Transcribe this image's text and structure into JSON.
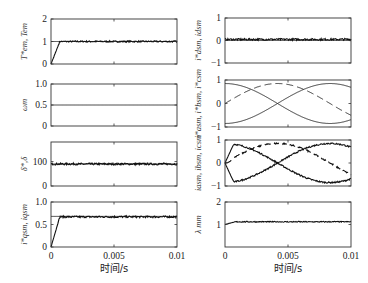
{
  "chart_data": [
    {
      "id": "te",
      "type": "line",
      "ylabel": "T*em, Tem",
      "ylim": [
        0,
        2
      ],
      "yticks": [
        "0",
        "1",
        "2"
      ],
      "xlim": [
        0,
        0.01
      ],
      "series": [
        {
          "name": "T*em",
          "style": "ref",
          "shape": "step",
          "value": 1
        },
        {
          "name": "Tem",
          "style": "noisy",
          "shape": "ramp",
          "value": 1,
          "ramp_end": 0.0007,
          "noise": 0.03
        }
      ]
    },
    {
      "id": "wm",
      "type": "line",
      "ylabel": "ωm",
      "ylim": [
        0,
        1.0
      ],
      "yticks": [
        "0",
        "0.5",
        "1.0"
      ],
      "xlim": [
        0,
        0.01
      ],
      "series": [
        {
          "name": "ωm",
          "style": "ref",
          "shape": "const",
          "value": 0.5
        }
      ]
    },
    {
      "id": "delta",
      "type": "line",
      "ylabel": "δ*,δ",
      "ylim": [
        0,
        180
      ],
      "yticks": [
        "0",
        "100"
      ],
      "xlim": [
        0,
        0.01
      ],
      "series": [
        {
          "name": "δ*",
          "style": "ref",
          "shape": "const",
          "value": 90
        },
        {
          "name": "δ",
          "style": "noisy",
          "shape": "const",
          "value": 90,
          "noise": 4
        }
      ]
    },
    {
      "id": "iqsm",
      "type": "line",
      "ylabel": "i*qsm, iqsm",
      "ylim": [
        0,
        1.0
      ],
      "yticks": [
        "0",
        "0.5",
        "1.0"
      ],
      "xticks": [
        "0",
        "0.005",
        "0.01"
      ],
      "xlabel": "时间/s",
      "xlim": [
        0,
        0.01
      ],
      "series": [
        {
          "name": "i*qsm",
          "style": "ref",
          "shape": "const",
          "value": 0.68
        },
        {
          "name": "iqsm",
          "style": "noisy",
          "shape": "ramp",
          "value": 0.67,
          "ramp_end": 0.0007,
          "noise": 0.02
        }
      ]
    },
    {
      "id": "idsm",
      "type": "line",
      "ylabel": "i*dsm, idsm",
      "ylim": [
        -1,
        1
      ],
      "yticks": [
        "-1",
        "0",
        "1"
      ],
      "xlim": [
        0,
        0.01
      ],
      "series": [
        {
          "name": "i*dsm",
          "style": "ref",
          "shape": "const",
          "value": 0
        },
        {
          "name": "idsm",
          "style": "noisy",
          "shape": "const",
          "value": 0.05,
          "noise": 0.04
        }
      ]
    },
    {
      "id": "iref3",
      "type": "line",
      "ylabel": "i*asm, i*bsm, i*csm",
      "ylim": [
        -1,
        1
      ],
      "yticks": [
        "-1",
        "0",
        "1"
      ],
      "xlim": [
        0,
        0.01
      ],
      "series": [
        {
          "name": "i*asm",
          "style": "solid",
          "shape": "sine",
          "amp": 0.85,
          "phase_deg": 90
        },
        {
          "name": "i*bsm",
          "style": "dashed",
          "shape": "sine",
          "amp": 0.85,
          "phase_deg": 0
        },
        {
          "name": "i*csm",
          "style": "solid",
          "shape": "sine",
          "amp": 0.85,
          "phase_deg": -90
        }
      ]
    },
    {
      "id": "i3",
      "type": "line",
      "ylabel": "iasm, ibsm, icsm",
      "ylim": [
        -1,
        1
      ],
      "yticks": [
        "-1",
        "0",
        "1"
      ],
      "xlim": [
        0,
        0.01
      ],
      "series": [
        {
          "name": "iasm",
          "style": "noisy",
          "shape": "sine",
          "amp": 0.85,
          "phase_deg": 90,
          "ramp_end": 0.0007,
          "noise": 0.03
        },
        {
          "name": "ibsm",
          "style": "noisy-dashed",
          "shape": "sine",
          "amp": 0.85,
          "phase_deg": 0,
          "ramp_end": 0.0007,
          "noise": 0.03
        },
        {
          "name": "icsm",
          "style": "noisy",
          "shape": "sine",
          "amp": 0.85,
          "phase_deg": -90,
          "ramp_end": 0.0007,
          "noise": 0.03
        }
      ]
    },
    {
      "id": "lambda",
      "type": "line",
      "ylabel": "λ mm",
      "ylim": [
        0,
        2
      ],
      "yticks": [
        "1",
        "2"
      ],
      "xticks": [
        "0",
        "0.005",
        "0.01"
      ],
      "xlabel": "时间/s",
      "xlim": [
        0,
        0.01
      ],
      "series": [
        {
          "name": "λmm",
          "style": "noisy",
          "shape": "rise",
          "value": 1.12,
          "start": 1.0,
          "ramp_end": 0.0008,
          "noise": 0.02
        }
      ]
    }
  ],
  "layout": {
    "panels": [
      {
        "ref": 0,
        "x": 51,
        "y": 19,
        "w": 126,
        "h": 45
      },
      {
        "ref": 1,
        "x": 51,
        "y": 84,
        "w": 126,
        "h": 42
      },
      {
        "ref": 2,
        "x": 51,
        "y": 142,
        "w": 126,
        "h": 44
      },
      {
        "ref": 3,
        "x": 51,
        "y": 202,
        "w": 126,
        "h": 45
      },
      {
        "ref": 4,
        "x": 225,
        "y": 18,
        "w": 126,
        "h": 45
      },
      {
        "ref": 5,
        "x": 225,
        "y": 80,
        "w": 126,
        "h": 47
      },
      {
        "ref": 6,
        "x": 225,
        "y": 140,
        "w": 126,
        "h": 46
      },
      {
        "ref": 7,
        "x": 225,
        "y": 202,
        "w": 126,
        "h": 45
      }
    ]
  }
}
